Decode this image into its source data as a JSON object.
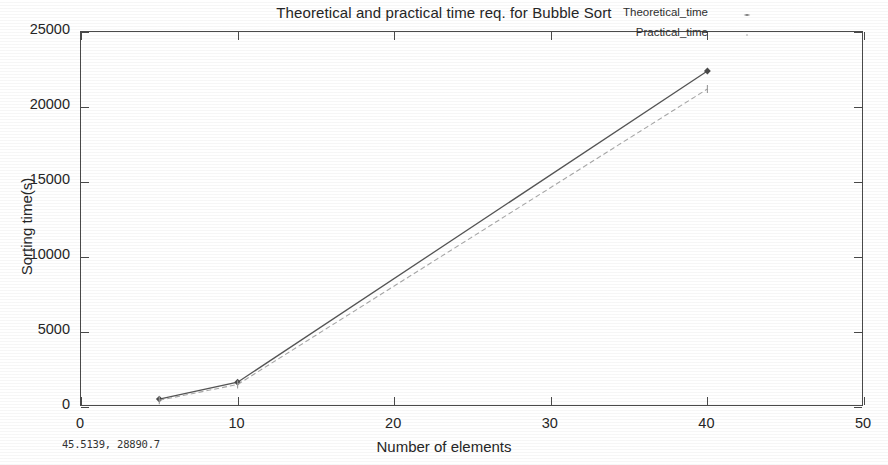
{
  "chart_data": {
    "type": "line",
    "title": "Theoretical and practical time req. for Bubble Sort",
    "xlabel": "Number of elements",
    "ylabel": "Sorting time(s)",
    "xlim": [
      0,
      50
    ],
    "ylim": [
      0,
      25000
    ],
    "xticks": [
      "0",
      "10",
      "20",
      "30",
      "40",
      "50"
    ],
    "xtick_values": [
      0,
      10,
      20,
      30,
      40,
      50
    ],
    "yticks": [
      "0",
      "5000",
      "10000",
      "15000",
      "20000",
      "25000"
    ],
    "ytick_values": [
      0,
      5000,
      10000,
      15000,
      20000,
      25000
    ],
    "grid": false,
    "legend_position": "top-right-inside",
    "x": [
      5,
      10,
      40
    ],
    "series": [
      {
        "name": "Theoretical_time",
        "values": [
          530,
          1650,
          22400
        ],
        "color": "#555555",
        "style": "solid",
        "marker": "diamond"
      },
      {
        "name": "Practical_time",
        "values": [
          450,
          1500,
          21200
        ],
        "color": "#a8a8a8",
        "style": "dashed",
        "marker": "tick"
      }
    ]
  },
  "legend": {
    "entries": [
      {
        "label": "Theoretical_time"
      },
      {
        "label": "Practical_time"
      }
    ]
  },
  "statusbar": {
    "coordinates": "45.5139, 28890.7"
  }
}
